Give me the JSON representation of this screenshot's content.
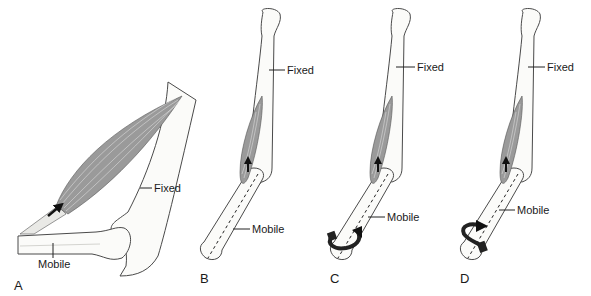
{
  "figure": {
    "panels": [
      {
        "id": "A",
        "label": "A",
        "fixed_label": "Fixed",
        "mobile_label": "Mobile",
        "motion": "linear-pull"
      },
      {
        "id": "B",
        "label": "B",
        "fixed_label": "Fixed",
        "mobile_label": "Mobile",
        "motion": "linear-pull-along-axis"
      },
      {
        "id": "C",
        "label": "C",
        "fixed_label": "Fixed",
        "mobile_label": "Mobile",
        "motion": "rotation-counterclockwise"
      },
      {
        "id": "D",
        "label": "D",
        "fixed_label": "Fixed",
        "mobile_label": "Mobile",
        "motion": "rotation-clockwise"
      }
    ]
  }
}
